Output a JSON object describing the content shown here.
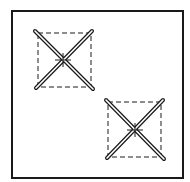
{
  "diagram": {
    "title": "",
    "background": "#ffffff",
    "stroke": "#1a1a1a",
    "frame": {
      "x": 12,
      "y": 11,
      "width": 171,
      "height": 167,
      "stroke_width": 2
    },
    "elements": [
      {
        "name": "crossed-brace-1",
        "dashed_square": {
          "x": 38,
          "y": 33,
          "width": 53,
          "height": 54
        },
        "center": {
          "x": 63,
          "y": 60
        },
        "diagonals": [
          {
            "x1": 35,
            "y1": 31,
            "x2": 93,
            "y2": 89
          },
          {
            "x1": 92,
            "y1": 31,
            "x2": 36,
            "y2": 88
          }
        ]
      },
      {
        "name": "crossed-brace-2",
        "dashed_square": {
          "x": 108,
          "y": 102,
          "width": 53,
          "height": 55
        },
        "center": {
          "x": 135,
          "y": 130
        },
        "diagonals": [
          {
            "x1": 106,
            "y1": 100,
            "x2": 164,
            "y2": 159
          },
          {
            "x1": 163,
            "y1": 100,
            "x2": 107,
            "y2": 158
          }
        ]
      }
    ]
  }
}
